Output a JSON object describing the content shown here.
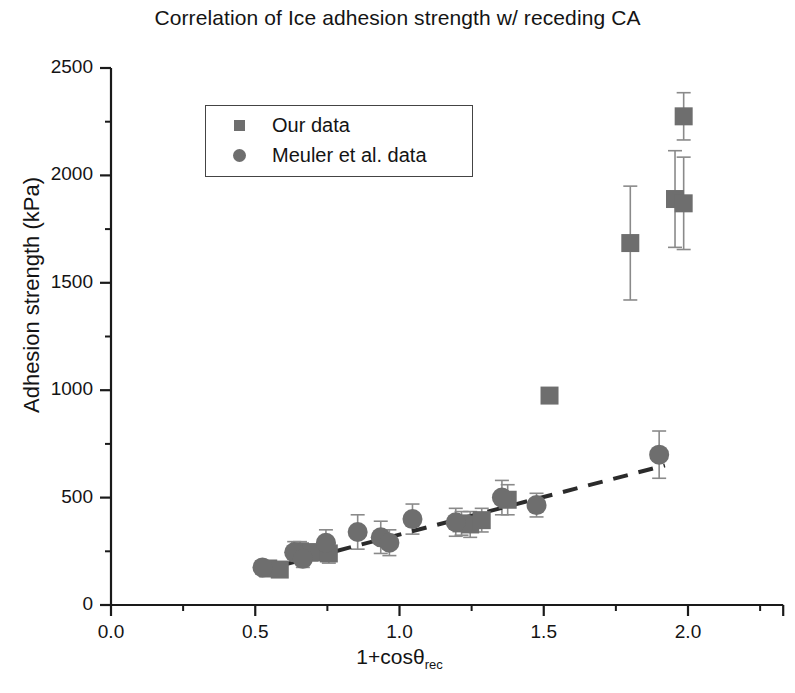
{
  "chart_data": {
    "type": "scatter",
    "title": "Correlation of Ice adhesion strength w/ receding CA",
    "xlabel": "1+cosθ",
    "xlabel_sub": "rec",
    "ylabel": "Adhesion strength (kPa)",
    "xlim": [
      0.0,
      2.33
    ],
    "ylim": [
      0,
      2500
    ],
    "xticks": [
      "0.0",
      "0.5",
      "1.0",
      "1.5",
      "2.0"
    ],
    "xtick_values": [
      0.0,
      0.5,
      1.0,
      1.5,
      2.0
    ],
    "yticks": [
      "0",
      "500",
      "1000",
      "1500",
      "2000",
      "2500"
    ],
    "ytick_values": [
      0,
      500,
      1000,
      1500,
      2000,
      2500
    ],
    "grid": false,
    "legend_position": "upper left inside",
    "marker_color": "#6e6e6e",
    "errorbar_color": "#8a8a8a",
    "trendline_color": "#2b2b2b",
    "series": [
      {
        "name": "Our data",
        "marker": "square",
        "points": [
          {
            "x": 0.545,
            "y": 170,
            "yerr": 25
          },
          {
            "x": 0.585,
            "y": 165,
            "yerr": 25
          },
          {
            "x": 0.655,
            "y": 250,
            "yerr": 45
          },
          {
            "x": 0.695,
            "y": 245,
            "yerr": 40
          },
          {
            "x": 0.755,
            "y": 240,
            "yerr": 45
          },
          {
            "x": 1.215,
            "y": 380,
            "yerr": 55
          },
          {
            "x": 1.245,
            "y": 375,
            "yerr": 60
          },
          {
            "x": 1.285,
            "y": 395,
            "yerr": 55
          },
          {
            "x": 1.375,
            "y": 490,
            "yerr": 70
          },
          {
            "x": 1.52,
            "y": 975,
            "yerr": 18
          },
          {
            "x": 1.8,
            "y": 1685,
            "yerr": 265
          },
          {
            "x": 1.955,
            "y": 1890,
            "yerr": 225
          },
          {
            "x": 1.985,
            "y": 1870,
            "yerr": 215
          },
          {
            "x": 1.985,
            "y": 2275,
            "yerr": 110
          }
        ]
      },
      {
        "name": "Meuler et al. data",
        "marker": "circle",
        "points": [
          {
            "x": 0.525,
            "y": 175,
            "yerr": 30
          },
          {
            "x": 0.635,
            "y": 245,
            "yerr": 50
          },
          {
            "x": 0.665,
            "y": 215,
            "yerr": 40
          },
          {
            "x": 0.745,
            "y": 290,
            "yerr": 60
          },
          {
            "x": 0.855,
            "y": 340,
            "yerr": 80
          },
          {
            "x": 0.935,
            "y": 315,
            "yerr": 75
          },
          {
            "x": 0.965,
            "y": 290,
            "yerr": 60
          },
          {
            "x": 1.045,
            "y": 400,
            "yerr": 70
          },
          {
            "x": 1.195,
            "y": 385,
            "yerr": 65
          },
          {
            "x": 1.355,
            "y": 500,
            "yerr": 80
          },
          {
            "x": 1.475,
            "y": 465,
            "yerr": 55
          },
          {
            "x": 1.9,
            "y": 700,
            "yerr": 110
          }
        ]
      }
    ],
    "trendline": {
      "style": "dashed",
      "x_start": 0.52,
      "y_start": 160,
      "x_end": 1.92,
      "y_end": 650
    }
  }
}
